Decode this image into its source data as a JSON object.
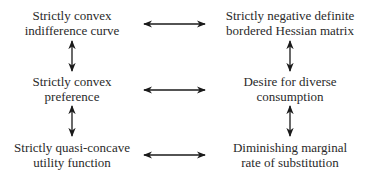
{
  "diagram": {
    "nodes": [
      {
        "id": "convex-indifference-curve",
        "lines": [
          "Strictly convex",
          "indifference curve"
        ],
        "column": "left",
        "row": 1
      },
      {
        "id": "negative-definite-hessian",
        "lines": [
          "Strictly negative definite",
          "bordered Hessian matrix"
        ],
        "column": "right",
        "row": 1
      },
      {
        "id": "convex-preference",
        "lines": [
          "Strictly convex",
          "preference"
        ],
        "column": "left",
        "row": 2
      },
      {
        "id": "diverse-consumption",
        "lines": [
          "Desire for diverse",
          "consumption"
        ],
        "column": "right",
        "row": 2
      },
      {
        "id": "quasi-concave-utility",
        "lines": [
          "Strictly quasi-concave",
          "utility function"
        ],
        "column": "left",
        "row": 3
      },
      {
        "id": "diminishing-mrs",
        "lines": [
          "Diminishing marginal",
          "rate of substitution"
        ],
        "column": "right",
        "row": 3
      }
    ],
    "edges": [
      {
        "from": "convex-indifference-curve",
        "to": "negative-definite-hessian",
        "type": "bidirectional"
      },
      {
        "from": "convex-preference",
        "to": "diverse-consumption",
        "type": "bidirectional"
      },
      {
        "from": "quasi-concave-utility",
        "to": "diminishing-mrs",
        "type": "bidirectional"
      },
      {
        "from": "convex-indifference-curve",
        "to": "convex-preference",
        "type": "bidirectional"
      },
      {
        "from": "convex-preference",
        "to": "quasi-concave-utility",
        "type": "bidirectional"
      },
      {
        "from": "negative-definite-hessian",
        "to": "diverse-consumption",
        "type": "bidirectional"
      },
      {
        "from": "diverse-consumption",
        "to": "diminishing-mrs",
        "type": "bidirectional"
      }
    ],
    "colors": {
      "text": "#2a2a2a",
      "arrow": "#1a1a1a",
      "background": "#ffffff"
    }
  }
}
